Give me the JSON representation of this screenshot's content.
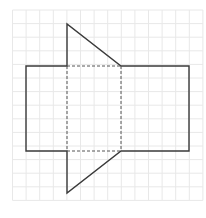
{
  "diagram": {
    "grid": {
      "origin_x": 12.5,
      "origin_y": 10,
      "cell_size": 13.6,
      "cols": 14,
      "rows": 14,
      "line_color": "#e8e8e8"
    },
    "colors": {
      "outline": "#3a3a3a",
      "dashed": "#555555",
      "background": "#ffffff"
    },
    "shapes": {
      "left_rectangle": {
        "x": 26,
        "y": 66,
        "w": 41,
        "h": 85
      },
      "center_square_dashed": {
        "x": 67,
        "y": 66,
        "w": 54,
        "h": 85
      },
      "right_rectangle": {
        "x": 121,
        "y": 66,
        "w": 68,
        "h": 85
      },
      "top_triangle": [
        [
          67,
          24
        ],
        [
          121,
          66
        ],
        [
          67,
          66
        ]
      ],
      "bottom_triangle": [
        [
          67,
          151
        ],
        [
          121,
          151
        ],
        [
          67,
          193
        ]
      ]
    }
  }
}
